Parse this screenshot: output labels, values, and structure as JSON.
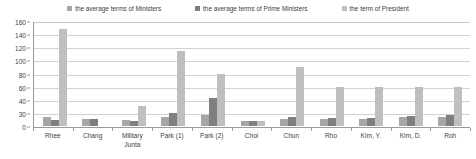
{
  "chart_data": {
    "type": "bar",
    "title": "",
    "xlabel": "",
    "ylabel": "",
    "ylim": [
      0,
      160
    ],
    "grid": true,
    "legend_position": "top",
    "categories": [
      "Rhee",
      "Chang",
      "Military Junta",
      "Park (1)",
      "Park (2)",
      "Choi",
      "Chun",
      "Rho",
      "Kim, Y.",
      "Kim, D.",
      "Roh"
    ],
    "ytick_labels": [
      "160",
      "140",
      "120",
      "100",
      "80",
      "60",
      "40",
      "30",
      "0"
    ],
    "ytick_values": [
      160,
      140,
      120,
      100,
      80,
      60,
      40,
      20,
      0
    ],
    "series": [
      {
        "name": "the average terms of Ministers",
        "color": "#a6a6a6",
        "values": [
          14,
          11,
          9,
          14,
          17,
          7,
          11,
          11,
          11,
          13,
          14
        ]
      },
      {
        "name": "the average terms of Prime Ministers",
        "color": "#7f7f7f",
        "values": [
          9,
          10,
          7,
          20,
          42,
          8,
          14,
          12,
          12,
          15,
          17
        ]
      },
      {
        "name": "the term of President",
        "color": "#bfbfbf",
        "values": [
          148,
          0,
          31,
          115,
          80,
          8,
          90,
          60,
          60,
          60,
          60
        ]
      }
    ]
  },
  "legend": {
    "items": [
      {
        "label": "the average terms of Ministers",
        "color": "#a6a6a6"
      },
      {
        "label": "the average terms of Prime Ministers",
        "color": "#7f7f7f"
      },
      {
        "label": "the term of President",
        "color": "#bfbfbf"
      }
    ]
  }
}
